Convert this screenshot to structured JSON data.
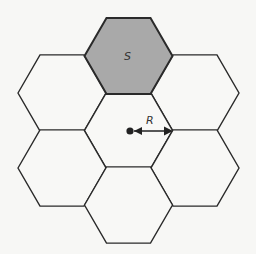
{
  "diagram": {
    "cell_radius_px": 44,
    "center": [
      128.5,
      130.5
    ],
    "colors": {
      "background": "#f7f7f5",
      "cell_fill": "#f8f8f6",
      "serving_cell_fill": "#a9a9a9",
      "stroke": "#2a2a2a"
    },
    "cells": [
      {
        "id": "top",
        "label": "S",
        "highlighted": true,
        "cx": 128.5,
        "cy": 56
      },
      {
        "id": "upper-left",
        "label": "",
        "highlighted": false,
        "cx": 62,
        "cy": 93
      },
      {
        "id": "upper-right",
        "label": "",
        "highlighted": false,
        "cx": 195,
        "cy": 93
      },
      {
        "id": "center",
        "label": "",
        "highlighted": false,
        "cx": 128.5,
        "cy": 130.5
      },
      {
        "id": "lower-left",
        "label": "",
        "highlighted": false,
        "cx": 62,
        "cy": 168
      },
      {
        "id": "lower-right",
        "label": "",
        "highlighted": false,
        "cx": 195,
        "cy": 168
      },
      {
        "id": "bottom",
        "label": "",
        "highlighted": false,
        "cx": 128.5,
        "cy": 205
      }
    ],
    "serving_label": "S",
    "radius_label": "R",
    "base_station_icon": "dot-icon"
  }
}
